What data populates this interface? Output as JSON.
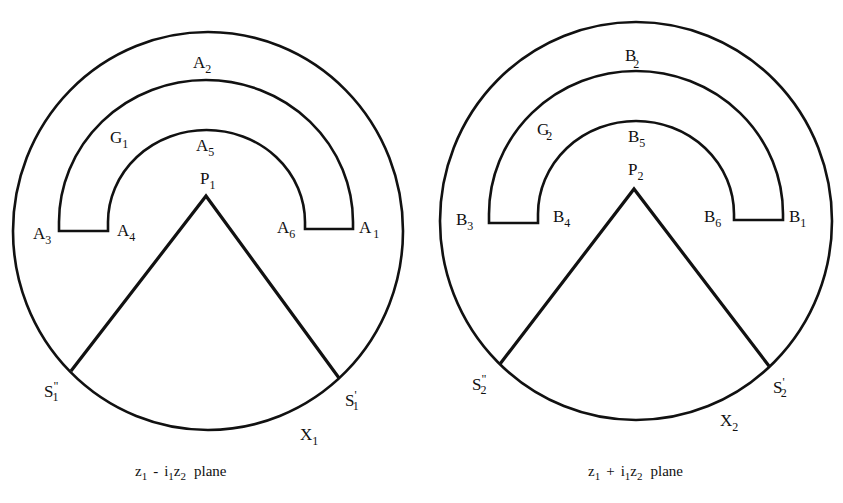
{
  "colors": {
    "line": "#111111",
    "background": "#ffffff"
  },
  "panels": [
    {
      "id": "left",
      "caption": {
        "z_a": "z",
        "z_a_sub": "1",
        "op": "-",
        "i": "i",
        "i_sub": "1",
        "z_b": "z",
        "z_b_sub": "2",
        "word": "plane"
      },
      "labels": {
        "A2": {
          "main": "A",
          "sub": "2"
        },
        "G1": {
          "main": "G",
          "sub": "1"
        },
        "A5": {
          "main": "A",
          "sub": "5"
        },
        "P1": {
          "main": "P",
          "sub": "1"
        },
        "A3": {
          "main": "A",
          "sub": "3"
        },
        "A4": {
          "main": "A",
          "sub": "4"
        },
        "A6": {
          "main": "A",
          "sub": "6"
        },
        "A1": {
          "main": "A",
          "sub": "1"
        },
        "S1pp": {
          "main": "S",
          "prime": "\"",
          "sub": "1"
        },
        "S1p": {
          "main": "S",
          "prime": "'",
          "sub": "1"
        },
        "X1": {
          "main": "X",
          "sub": "1"
        }
      }
    },
    {
      "id": "right",
      "caption": {
        "z_a": "z",
        "z_a_sub": "1",
        "op": "+",
        "i": "i",
        "i_sub": "1",
        "z_b": "z",
        "z_b_sub": "2",
        "word": "plane"
      },
      "labels": {
        "B2": {
          "main": "B",
          "sub": "2"
        },
        "G2": {
          "main": "G",
          "sub": "2"
        },
        "B5": {
          "main": "B",
          "sub": "5"
        },
        "P2": {
          "main": "P",
          "sub": "2"
        },
        "B3": {
          "main": "B",
          "sub": "3"
        },
        "B4": {
          "main": "B",
          "sub": "4"
        },
        "B6": {
          "main": "B",
          "sub": "6"
        },
        "B1": {
          "main": "B",
          "sub": "1"
        },
        "S2pp": {
          "main": "S",
          "prime": "\"",
          "sub": "2"
        },
        "S2p": {
          "main": "S",
          "prime": "'",
          "sub": "2"
        },
        "X2": {
          "main": "X",
          "sub": "2"
        }
      }
    }
  ]
}
